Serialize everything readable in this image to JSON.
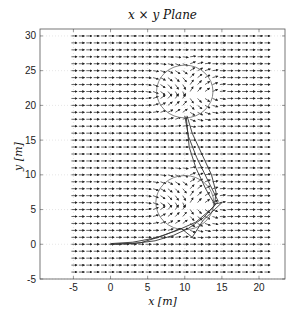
{
  "chart_data": {
    "type": "quiver",
    "title": "x × y Plane",
    "xlabel": "x [m]",
    "ylabel": "y [m]",
    "xlim": [
      -9.5,
      23.5
    ],
    "ylim": [
      -5,
      31
    ],
    "xticks": [
      -5,
      0,
      5,
      10,
      15,
      20
    ],
    "yticks": [
      -5,
      0,
      5,
      10,
      15,
      20,
      25,
      30
    ],
    "grid": true,
    "vector_field": {
      "x_range": [
        -5,
        21
      ],
      "y_range": [
        -4,
        30
      ],
      "spacing": 1,
      "default_direction": [
        1,
        0
      ],
      "description": "uniform flow in +x direction, deflected around circular obstacles"
    },
    "obstacles": [
      {
        "name": "upper-circle",
        "center": [
          10,
          22
        ],
        "radius": 3.8
      },
      {
        "name": "lower-circle",
        "center": [
          10,
          6
        ],
        "radius": 3.9
      }
    ],
    "trajectories": [
      {
        "name": "path-1",
        "points": [
          [
            0,
            0
          ],
          [
            3,
            0.1
          ],
          [
            6,
            0.5
          ],
          [
            8.5,
            1.3
          ],
          [
            10.5,
            2.3
          ],
          [
            12.5,
            3.8
          ],
          [
            14,
            5.6
          ],
          [
            14.2,
            7.5
          ],
          [
            13.6,
            10
          ],
          [
            12.3,
            13
          ],
          [
            11,
            16
          ],
          [
            10.3,
            18.5
          ]
        ]
      },
      {
        "name": "path-2",
        "points": [
          [
            0,
            0.1
          ],
          [
            3,
            0.3
          ],
          [
            6,
            0.9
          ],
          [
            9,
            2
          ],
          [
            11.5,
            3.2
          ],
          [
            13.8,
            5.3
          ],
          [
            14.5,
            6.2
          ],
          [
            13.2,
            9
          ],
          [
            11.6,
            12.5
          ],
          [
            10.5,
            15.5
          ],
          [
            10,
            18.5
          ]
        ]
      },
      {
        "name": "path-3",
        "points": [
          [
            0,
            0
          ],
          [
            4,
            0.2
          ],
          [
            7,
            1.2
          ],
          [
            9.5,
            2.3
          ],
          [
            11,
            1
          ],
          [
            12.5,
            3.5
          ],
          [
            14,
            5
          ],
          [
            15,
            6
          ],
          [
            14,
            5.8
          ],
          [
            12.8,
            8
          ],
          [
            11.5,
            11
          ],
          [
            10.6,
            14
          ],
          [
            10.2,
            18.2
          ]
        ]
      }
    ]
  },
  "labels": {
    "title": "x × y Plane",
    "xlabel": "x [m]",
    "ylabel": "y [m]"
  },
  "colors": {
    "axes": "#555555",
    "grid": "#cccccc",
    "arrows": "#222222",
    "circle": "#777777",
    "trajectory": "#333333"
  }
}
